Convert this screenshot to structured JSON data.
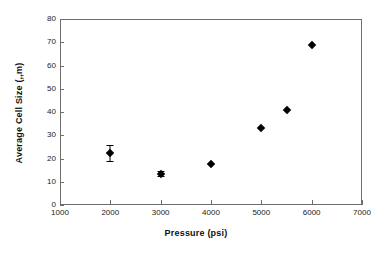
{
  "chart_data": {
    "type": "scatter",
    "title": "",
    "xlabel": "Pressure (psi)",
    "ylabel": "Average Cell Size (,,m)",
    "ylabel_intended": "Average Cell Size (µm)",
    "xlim": [
      1000,
      7000
    ],
    "ylim": [
      0,
      80
    ],
    "xticks": [
      1000,
      2000,
      3000,
      4000,
      5000,
      6000,
      7000
    ],
    "yticks": [
      0,
      10,
      20,
      30,
      40,
      50,
      60,
      70,
      80
    ],
    "xtick_labels": [
      "1000",
      "2000",
      "3000",
      "4000",
      "5000",
      "6000",
      "7000"
    ],
    "ytick_labels": [
      "0",
      "10",
      "20",
      "30",
      "40",
      "50",
      "60",
      "70",
      "80"
    ],
    "grid": false,
    "legend": false,
    "marker": "diamond",
    "marker_color": "#000000",
    "frame_color": "#6e6e6e",
    "series": [
      {
        "name": "Average Cell Size",
        "points": [
          {
            "x": 2000,
            "y": 22.5,
            "yerr": 3.5
          },
          {
            "x": 3000,
            "y": 13.5,
            "yerr": 1.2
          },
          {
            "x": 4000,
            "y": 17.8,
            "yerr": 0
          },
          {
            "x": 5000,
            "y": 33.0,
            "yerr": 0
          },
          {
            "x": 5500,
            "y": 41.0,
            "yerr": 0
          },
          {
            "x": 6000,
            "y": 69.0,
            "yerr": 0
          }
        ]
      }
    ]
  }
}
